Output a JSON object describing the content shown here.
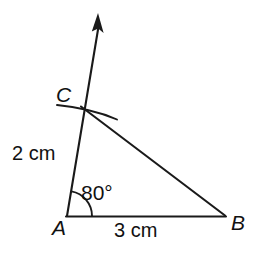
{
  "figure": {
    "kind": "geometry-construction-diagram",
    "background_color": "#ffffff",
    "stroke_color": "#1a1a1a",
    "canvas": {
      "width": 259,
      "height": 255
    },
    "points": {
      "A": {
        "x": 67,
        "y": 216,
        "label": "A"
      },
      "B": {
        "x": 225,
        "y": 216,
        "label": "B"
      },
      "C": {
        "x": 82,
        "y": 106,
        "label": "C"
      },
      "ray_tip": {
        "x": 98,
        "y": 14
      }
    },
    "segments": [
      {
        "name": "AB",
        "from": "A",
        "to": "B",
        "length_label": "3 cm"
      },
      {
        "name": "AC",
        "from": "A",
        "to": "C",
        "length_label": "2 cm"
      },
      {
        "name": "CB",
        "from": "C",
        "to": "B",
        "length_label": ""
      }
    ],
    "ray": {
      "name": "ray-A-through-C",
      "from": "A",
      "through": "C",
      "arrowhead": true
    },
    "angle": {
      "at": "A",
      "between": [
        "AB",
        "AC"
      ],
      "value_label": "80°",
      "arc_radius": 25
    },
    "construction_arc": {
      "name": "compass-arc-through-C",
      "start": {
        "x": 57,
        "y": 105
      },
      "control": {
        "x": 90,
        "y": 110
      },
      "end": {
        "x": 117,
        "y": 119
      }
    }
  },
  "labels": {
    "vertex_a": "A",
    "vertex_b": "B",
    "vertex_c": "C",
    "side_ac": "2 cm",
    "side_ab": "3 cm",
    "angle_a": "80°"
  }
}
